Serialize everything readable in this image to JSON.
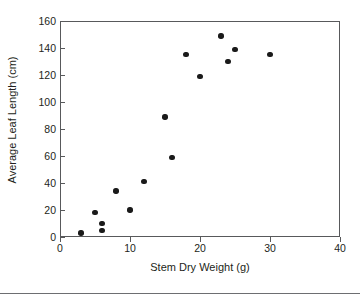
{
  "chart_data": {
    "type": "scatter",
    "title": "",
    "xlabel": "Stem Dry Weight (g)",
    "ylabel": "Average Leaf Length (cm)",
    "xlim": [
      0,
      40
    ],
    "ylim": [
      0,
      160
    ],
    "xticks": [
      0,
      10,
      20,
      30,
      40
    ],
    "yticks": [
      0,
      20,
      40,
      60,
      80,
      100,
      120,
      140,
      160
    ],
    "xtick_labels": [
      "0",
      "10",
      "20",
      "30",
      "40"
    ],
    "ytick_labels": [
      "0",
      "20",
      "40",
      "60",
      "80",
      "100",
      "120",
      "140",
      "160"
    ],
    "grid": false,
    "legend": null,
    "marker": "filled-circle",
    "marker_color": "#1a1a1a",
    "axis_color": "#58595b",
    "points": [
      {
        "x": 3,
        "y": 3
      },
      {
        "x": 5,
        "y": 18
      },
      {
        "x": 6,
        "y": 10
      },
      {
        "x": 6,
        "y": 5
      },
      {
        "x": 8,
        "y": 34
      },
      {
        "x": 10,
        "y": 20
      },
      {
        "x": 12,
        "y": 41
      },
      {
        "x": 15,
        "y": 89
      },
      {
        "x": 16,
        "y": 59
      },
      {
        "x": 18,
        "y": 135
      },
      {
        "x": 20,
        "y": 119
      },
      {
        "x": 23,
        "y": 149
      },
      {
        "x": 24,
        "y": 130
      },
      {
        "x": 25,
        "y": 139
      },
      {
        "x": 30,
        "y": 135
      }
    ]
  },
  "figure": {
    "x_axis_title": "Stem Dry Weight (g)",
    "y_axis_title": "Average Leaf Length (cm)"
  }
}
